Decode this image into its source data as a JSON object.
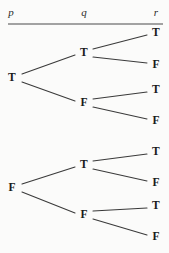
{
  "figure": {
    "width": 169,
    "height": 253,
    "background_color": "#fbfbfa",
    "line_color": "#3a3a3a",
    "text_color": "#1a1a1a",
    "rule_color": "#4a4a4a"
  },
  "header": {
    "columns": [
      {
        "label": "p",
        "x": 11,
        "y": 12
      },
      {
        "label": "q",
        "x": 84,
        "y": 12
      },
      {
        "label": "r",
        "x": 156,
        "y": 12
      }
    ],
    "rule": {
      "x1": 8,
      "x2": 163,
      "y": 24
    }
  },
  "chart_data": {
    "type": "tree",
    "variables": [
      "p",
      "q",
      "r"
    ],
    "values": [
      "T",
      "F"
    ],
    "nodes": [
      {
        "id": "p-T",
        "label": "T",
        "level": 1,
        "x": 12,
        "y": 78
      },
      {
        "id": "p-F",
        "label": "F",
        "level": 1,
        "x": 12,
        "y": 188
      },
      {
        "id": "p-T.q-T",
        "label": "T",
        "level": 2,
        "x": 84,
        "y": 53
      },
      {
        "id": "p-T.q-F",
        "label": "F",
        "level": 2,
        "x": 84,
        "y": 103
      },
      {
        "id": "p-F.q-T",
        "label": "T",
        "level": 2,
        "x": 84,
        "y": 165
      },
      {
        "id": "p-F.q-F",
        "label": "F",
        "level": 2,
        "x": 84,
        "y": 215
      },
      {
        "id": "p-T.q-T.r-T",
        "label": "T",
        "level": 3,
        "x": 156,
        "y": 33
      },
      {
        "id": "p-T.q-T.r-F",
        "label": "F",
        "level": 3,
        "x": 156,
        "y": 65
      },
      {
        "id": "p-T.q-F.r-T",
        "label": "T",
        "level": 3,
        "x": 156,
        "y": 90
      },
      {
        "id": "p-T.q-F.r-F",
        "label": "F",
        "level": 3,
        "x": 156,
        "y": 121
      },
      {
        "id": "p-F.q-T.r-T",
        "label": "T",
        "level": 3,
        "x": 156,
        "y": 152
      },
      {
        "id": "p-F.q-T.r-F",
        "label": "F",
        "level": 3,
        "x": 156,
        "y": 183
      },
      {
        "id": "p-F.q-F.r-T",
        "label": "T",
        "level": 3,
        "x": 156,
        "y": 206
      },
      {
        "id": "p-F.q-F.r-F",
        "label": "F",
        "level": 3,
        "x": 156,
        "y": 237
      }
    ],
    "edges": [
      {
        "from": "p-T",
        "to": "p-T.q-T",
        "x1": 22,
        "y1": 74,
        "x2": 75,
        "y2": 55
      },
      {
        "from": "p-T",
        "to": "p-T.q-F",
        "x1": 22,
        "y1": 82,
        "x2": 75,
        "y2": 101
      },
      {
        "from": "p-T.q-T",
        "to": "p-T.q-T.r-T",
        "x1": 93,
        "y1": 49,
        "x2": 147,
        "y2": 35
      },
      {
        "from": "p-T.q-T",
        "to": "p-T.q-T.r-F",
        "x1": 93,
        "y1": 57,
        "x2": 147,
        "y2": 63
      },
      {
        "from": "p-T.q-F",
        "to": "p-T.q-F.r-T",
        "x1": 93,
        "y1": 99,
        "x2": 147,
        "y2": 92
      },
      {
        "from": "p-T.q-F",
        "to": "p-T.q-F.r-F",
        "x1": 93,
        "y1": 107,
        "x2": 147,
        "y2": 119
      },
      {
        "from": "p-F",
        "to": "p-F.q-T",
        "x1": 22,
        "y1": 184,
        "x2": 75,
        "y2": 167
      },
      {
        "from": "p-F",
        "to": "p-F.q-F",
        "x1": 22,
        "y1": 192,
        "x2": 75,
        "y2": 213
      },
      {
        "from": "p-F.q-T",
        "to": "p-F.q-T.r-T",
        "x1": 93,
        "y1": 161,
        "x2": 147,
        "y2": 154
      },
      {
        "from": "p-F.q-T",
        "to": "p-F.q-T.r-F",
        "x1": 93,
        "y1": 169,
        "x2": 147,
        "y2": 181
      },
      {
        "from": "p-F.q-F",
        "to": "p-F.q-F.r-T",
        "x1": 93,
        "y1": 211,
        "x2": 147,
        "y2": 208
      },
      {
        "from": "p-F.q-F",
        "to": "p-F.q-F.r-F",
        "x1": 93,
        "y1": 219,
        "x2": 147,
        "y2": 235
      }
    ],
    "paths": [
      [
        "T",
        "T",
        "T"
      ],
      [
        "T",
        "T",
        "F"
      ],
      [
        "T",
        "F",
        "T"
      ],
      [
        "T",
        "F",
        "F"
      ],
      [
        "F",
        "T",
        "T"
      ],
      [
        "F",
        "T",
        "F"
      ],
      [
        "F",
        "F",
        "T"
      ],
      [
        "F",
        "F",
        "F"
      ]
    ]
  }
}
